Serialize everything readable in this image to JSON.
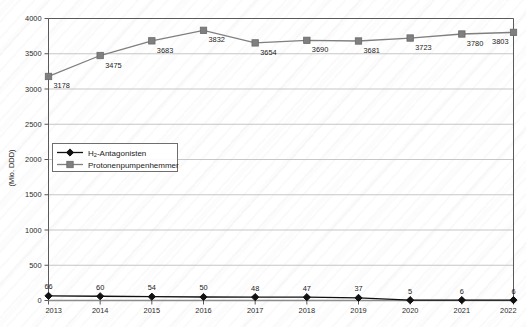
{
  "chart_data": {
    "type": "line",
    "title": "",
    "xlabel": "",
    "ylabel": "(Mio. DDD)",
    "categories": [
      "2013",
      "2014",
      "2015",
      "2016",
      "2017",
      "2018",
      "2019",
      "2020",
      "2021",
      "2022"
    ],
    "ylim": [
      0,
      4000
    ],
    "yticks": [
      0,
      500,
      1000,
      1500,
      2000,
      2500,
      3000,
      3500,
      4000
    ],
    "ytick_labels": [
      "0",
      "500",
      "1000",
      "1500",
      "2000",
      "2500",
      "3000",
      "3500",
      "4000"
    ],
    "grid": true,
    "legend_position": "left-middle",
    "series": [
      {
        "name": "H₂-Antagonisten",
        "name_base": "H",
        "name_sub": "2",
        "name_rest": "-Antagonisten",
        "marker": "diamond",
        "color": "#111111",
        "values": [
          66,
          60,
          54,
          50,
          48,
          47,
          37,
          5,
          6,
          6
        ],
        "labels": [
          "66",
          "60",
          "54",
          "50",
          "48",
          "47",
          "37",
          "5",
          "6",
          "6"
        ]
      },
      {
        "name": "Protonenpumpenhemmer",
        "marker": "square",
        "color": "#7f7f7f",
        "values": [
          3178,
          3475,
          3683,
          3832,
          3654,
          3690,
          3681,
          3723,
          3780,
          3803
        ],
        "labels": [
          "3178",
          "3475",
          "3683",
          "3832",
          "3654",
          "3690",
          "3681",
          "3723",
          "3780",
          "3803"
        ]
      }
    ]
  },
  "legend": {
    "items": [
      {
        "label": "H₂-Antagonisten",
        "marker": "diamond-icon",
        "color": "#111111"
      },
      {
        "label": "Protonenpumpenhemmer",
        "marker": "square-icon",
        "color": "#7f7f7f"
      }
    ]
  }
}
